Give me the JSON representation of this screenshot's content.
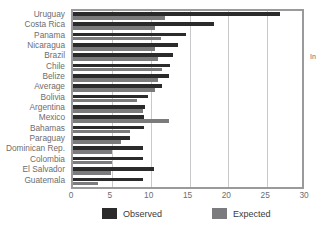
{
  "chart_data": {
    "type": "bar",
    "orientation": "horizontal",
    "title": "",
    "xlabel": "",
    "ylabel": "",
    "xlim": [
      0,
      30
    ],
    "xticks": [
      0,
      5,
      10,
      15,
      20,
      25,
      30
    ],
    "grid": true,
    "legend_position": "bottom",
    "categories": [
      "Uruguay",
      "Costa Rica",
      "Panama",
      "Nicaragua",
      "Brazil",
      "Chile",
      "Belize",
      "Average",
      "Bolivia",
      "Argentina",
      "Mexico",
      "Bahamas",
      "Paraguay",
      "Dominican Rep.",
      "Colombia",
      "El Salvador",
      "Guatemala"
    ],
    "series": [
      {
        "name": "Observed",
        "color": "#2b2b2b",
        "values": [
          26.6,
          18.2,
          14.5,
          13.5,
          12.9,
          12.5,
          12.3,
          11.5,
          9.7,
          9.3,
          9.2,
          9.1,
          7.3,
          9.0,
          9.0,
          10.4,
          9.0
        ]
      },
      {
        "name": "Expected",
        "color": "#7b7b7d",
        "values": [
          11.8,
          10.5,
          11.3,
          10.5,
          11.0,
          11.4,
          11.0,
          10.5,
          8.3,
          9.0,
          12.4,
          7.4,
          6.2,
          5.0,
          5.0,
          4.9,
          3.2
        ]
      }
    ],
    "legend": [
      {
        "label": "Observed",
        "swatch": "observed"
      },
      {
        "label": "Expected",
        "swatch": "expected"
      }
    ],
    "tick_labels": [
      "0",
      "5",
      "10",
      "15",
      "20",
      "25",
      "30"
    ]
  },
  "clipped_title": "",
  "right_note": "In"
}
